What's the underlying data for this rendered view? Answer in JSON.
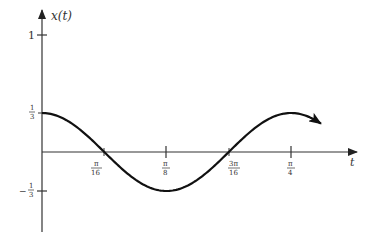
{
  "chart_data": {
    "type": "line",
    "title": "",
    "xlabel": "t",
    "ylabel": "x(t)",
    "function": "x(t) = (1/3) cos(8t)",
    "x_ticks": [
      {
        "value": 0.19635,
        "label_num": "π",
        "label_den": "16"
      },
      {
        "value": 0.392699,
        "label_num": "π",
        "label_den": "8"
      },
      {
        "value": 0.589049,
        "label_num": "3π",
        "label_den": "16"
      },
      {
        "value": 0.785398,
        "label_num": "π",
        "label_den": "4"
      }
    ],
    "y_ticks": [
      {
        "value": 1,
        "label": "1"
      },
      {
        "value": 0.3333,
        "label_num": "1",
        "label_den": "3"
      },
      {
        "value": -0.3333,
        "label_num": "1",
        "label_den": "3",
        "sign": "−"
      }
    ],
    "x": [
      0,
      0.098,
      0.196,
      0.295,
      0.393,
      0.491,
      0.589,
      0.687,
      0.785,
      0.88
    ],
    "series": [
      {
        "name": "x(t)",
        "values": [
          0.333,
          0.236,
          0.0,
          -0.236,
          -0.333,
          -0.236,
          0.0,
          0.236,
          0.333,
          0.24
        ]
      }
    ],
    "xlim": [
      0,
      0.92
    ],
    "ylim": [
      -0.45,
      1.1
    ],
    "grid": false,
    "legend": "none"
  },
  "axis_labels": {
    "y_axis": "x(t)",
    "x_axis": "t"
  }
}
